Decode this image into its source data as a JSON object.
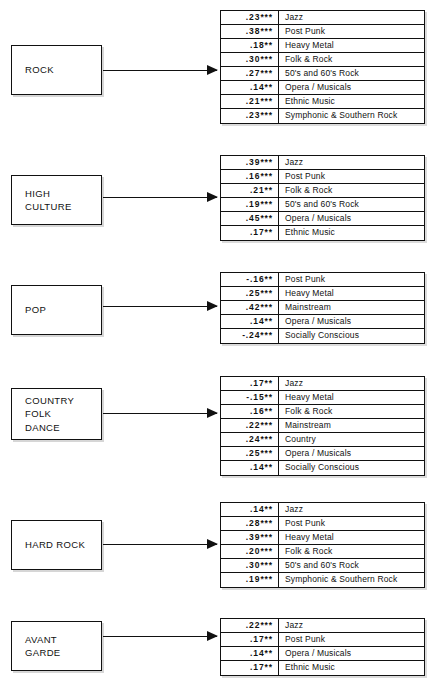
{
  "figure": {
    "type": "path-diagram"
  },
  "blocks": [
    {
      "id": "rock",
      "source_label": "ROCK",
      "box": {
        "x": 11,
        "y": 45,
        "w": 91,
        "h": 50
      },
      "arrow": {
        "x": 103,
        "y": 64,
        "w": 114,
        "h": 12
      },
      "table": {
        "y": 10
      },
      "rows": [
        {
          "coef": ".23***",
          "genre": "Jazz"
        },
        {
          "coef": ".38***",
          "genre": "Post Punk"
        },
        {
          "coef": ".18**",
          "genre": "Heavy Metal"
        },
        {
          "coef": ".30***",
          "genre": "Folk & Rock"
        },
        {
          "coef": ".27***",
          "genre": "50's and 60's Rock"
        },
        {
          "coef": ".14**",
          "genre": "Opera / Musicals"
        },
        {
          "coef": ".21***",
          "genre": "Ethnic Music"
        },
        {
          "coef": ".23***",
          "genre": "Symphonic & Southern Rock"
        }
      ]
    },
    {
      "id": "high-culture",
      "source_label": "HIGH\nCULTURE",
      "box": {
        "x": 11,
        "y": 175,
        "w": 91,
        "h": 50
      },
      "arrow": {
        "x": 103,
        "y": 191,
        "w": 114,
        "h": 12
      },
      "table": {
        "y": 155
      },
      "rows": [
        {
          "coef": ".39***",
          "genre": "Jazz"
        },
        {
          "coef": ".16***",
          "genre": "Post Punk"
        },
        {
          "coef": ".21**",
          "genre": "Folk & Rock"
        },
        {
          "coef": ".19***",
          "genre": "50's and 60's Rock"
        },
        {
          "coef": ".45***",
          "genre": "Opera / Musicals"
        },
        {
          "coef": ".17**",
          "genre": "Ethnic Music"
        }
      ]
    },
    {
      "id": "pop",
      "source_label": "POP",
      "box": {
        "x": 11,
        "y": 285,
        "w": 91,
        "h": 50
      },
      "arrow": {
        "x": 103,
        "y": 300,
        "w": 114,
        "h": 12
      },
      "table": {
        "y": 272
      },
      "rows": [
        {
          "coef": "-.16**",
          "genre": "Post Punk"
        },
        {
          "coef": ".25***",
          "genre": "Heavy Metal"
        },
        {
          "coef": ".42***",
          "genre": "Mainstream"
        },
        {
          "coef": ".14**",
          "genre": "Opera / Musicals"
        },
        {
          "coef": "-.24***",
          "genre": "Socially Conscious"
        }
      ]
    },
    {
      "id": "country-folk-dance",
      "source_label": "COUNTRY\nFOLK\nDANCE",
      "box": {
        "x": 11,
        "y": 388,
        "w": 91,
        "h": 52
      },
      "arrow": {
        "x": 103,
        "y": 407,
        "w": 114,
        "h": 12
      },
      "table": {
        "y": 376
      },
      "rows": [
        {
          "coef": ".17**",
          "genre": "Jazz"
        },
        {
          "coef": "-.15**",
          "genre": "Heavy Metal"
        },
        {
          "coef": ".16**",
          "genre": "Folk & Rock"
        },
        {
          "coef": ".22***",
          "genre": "Mainstream"
        },
        {
          "coef": ".24***",
          "genre": "Country"
        },
        {
          "coef": ".25***",
          "genre": "Opera / Musicals"
        },
        {
          "coef": ".14**",
          "genre": "Socially Conscious"
        }
      ]
    },
    {
      "id": "hard-rock",
      "source_label": "HARD ROCK",
      "box": {
        "x": 11,
        "y": 520,
        "w": 91,
        "h": 50
      },
      "arrow": {
        "x": 103,
        "y": 538,
        "w": 114,
        "h": 12
      },
      "table": {
        "y": 502
      },
      "rows": [
        {
          "coef": ".14**",
          "genre": "Jazz"
        },
        {
          "coef": ".28***",
          "genre": "Post Punk"
        },
        {
          "coef": ".39***",
          "genre": "Heavy Metal"
        },
        {
          "coef": ".20***",
          "genre": "Folk & Rock"
        },
        {
          "coef": ".30***",
          "genre": "50's and 60's Rock"
        },
        {
          "coef": ".19***",
          "genre": "Symphonic & Southern Rock"
        }
      ]
    },
    {
      "id": "avant-garde",
      "source_label": "AVANT\nGARDE",
      "box": {
        "x": 11,
        "y": 621,
        "w": 91,
        "h": 50
      },
      "arrow": {
        "x": 103,
        "y": 630,
        "w": 114,
        "h": 12
      },
      "table": {
        "y": 618
      },
      "rows": [
        {
          "coef": ".22***",
          "genre": "Jazz"
        },
        {
          "coef": ".17**",
          "genre": "Post Punk"
        },
        {
          "coef": ".14**",
          "genre": "Opera / Musicals"
        },
        {
          "coef": ".17**",
          "genre": "Ethnic Music"
        }
      ]
    }
  ]
}
